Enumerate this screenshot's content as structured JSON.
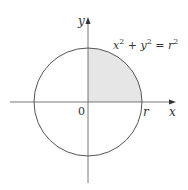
{
  "diagram": {
    "equation": {
      "x": "x",
      "y": "y",
      "plus": " + ",
      "eq": " = ",
      "r": "r",
      "exp": "2"
    },
    "axis_labels": {
      "x": "x",
      "y": "y"
    },
    "origin_label": "0",
    "radius_label": "r",
    "colors": {
      "stroke": "#555555",
      "shade": "#e6e6e6"
    }
  }
}
